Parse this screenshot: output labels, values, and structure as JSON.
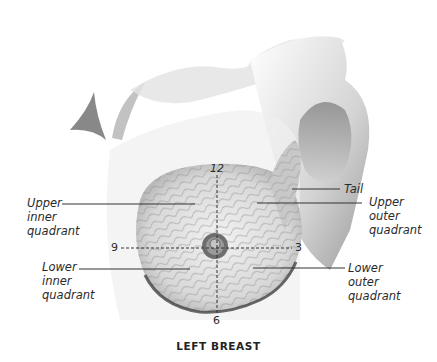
{
  "figure": {
    "caption": "LEFT BREAST",
    "labels": {
      "upper_inner": [
        "Upper",
        "inner",
        "quadrant"
      ],
      "lower_inner": [
        "Lower",
        "inner",
        "quadrant"
      ],
      "upper_outer": [
        "Upper",
        "outer",
        "quadrant"
      ],
      "lower_outer": [
        "Lower",
        "outer",
        "quadrant"
      ],
      "tail": "Tail"
    },
    "clock_positions": {
      "top": "12",
      "right": "3",
      "bottom": "6",
      "left": "9"
    }
  }
}
